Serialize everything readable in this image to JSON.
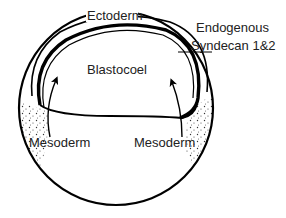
{
  "diagram": {
    "type": "embryo cross-section",
    "colors": {
      "stroke": "#000000",
      "text": "#222222",
      "background": "#ffffff"
    },
    "labels": {
      "ectoderm": "Ectoderm",
      "blastocoel": "Blastocoel",
      "syndecan_line1": "Endogenous",
      "syndecan_line2": "Syndecan 1&2",
      "mesoderm_left": "Mesoderm",
      "mesoderm_right": "Mesoderm"
    }
  }
}
